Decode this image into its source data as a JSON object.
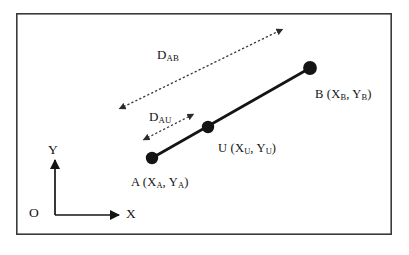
{
  "figure": {
    "type": "geometric-diagram",
    "title": "",
    "frame": {
      "x": 16,
      "y": 13,
      "width": 376,
      "height": 222,
      "stroke": "#3a3a3a",
      "stroke_width": 1.6,
      "fill": "#ffffff"
    },
    "axes": {
      "origin_label": "O",
      "x_label": "X",
      "y_label": "Y",
      "origin": {
        "x": 55,
        "y": 215
      },
      "x_end": {
        "x": 122,
        "y": 215
      },
      "y_end": {
        "x": 55,
        "y": 157
      },
      "stroke": "#141414"
    },
    "points": [
      {
        "id": "A",
        "label": "A (X",
        "sub1": "A",
        "mid": ", Y",
        "sub2": "A",
        "close": ")",
        "cx": 152,
        "cy": 158,
        "r": 6.2
      },
      {
        "id": "U",
        "label": "U (X",
        "sub1": "U",
        "mid": ", Y",
        "sub2": "U",
        "close": ")",
        "cx": 208,
        "cy": 127,
        "r": 6.2
      },
      {
        "id": "B",
        "label": "B (X",
        "sub1": "B",
        "mid": ", Y",
        "sub2": "B",
        "close": ")",
        "cx": 310,
        "cy": 68,
        "r": 6.8
      }
    ],
    "point_labels": {
      "A": {
        "text": "A (X",
        "s1": "A",
        "mid": ", Y",
        "s2": "A",
        "end": ")",
        "x": 131,
        "y": 176
      },
      "U": {
        "text": "U (X",
        "s1": "U",
        "mid": ", Y",
        "s2": "U",
        "end": ")",
        "x": 218,
        "y": 142
      },
      "B": {
        "text": "B (X",
        "s1": "B",
        "mid": ", Y",
        "s2": "B",
        "end": ")",
        "x": 315,
        "y": 88
      }
    },
    "segment_AB": {
      "from": {
        "x": 152,
        "y": 158
      },
      "to": {
        "x": 310,
        "y": 68
      },
      "stroke": "#141414",
      "stroke_width": 2.6,
      "style": "solid"
    },
    "distance_arrows": [
      {
        "id": "D_AB",
        "text": "D",
        "subscript": "AB",
        "label_x": 157,
        "label_y": 48,
        "from": {
          "x": 117,
          "y": 110
        },
        "to": {
          "x": 285,
          "y": 28
        },
        "style": "dotted",
        "stroke": "#3a3a3a",
        "stroke_width": 1.3,
        "arrowheads": "both"
      },
      {
        "id": "D_AU",
        "text": "D",
        "subscript": "AU",
        "label_x": 149,
        "label_y": 110,
        "from": {
          "x": 141,
          "y": 141
        },
        "to": {
          "x": 196,
          "y": 113
        },
        "style": "dotted",
        "stroke": "#3a3a3a",
        "stroke_width": 1.3,
        "arrowheads": "both"
      }
    ],
    "colors": {
      "ink": "#141414",
      "frame": "#3a3a3a",
      "dotted": "#3a3a3a",
      "background": "#ffffff"
    }
  }
}
